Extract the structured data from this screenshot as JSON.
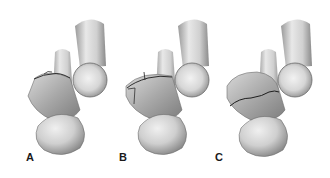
{
  "figure": {
    "panels": [
      {
        "label": "A",
        "fracture": "transverse line across superior articular surface"
      },
      {
        "label": "B",
        "fracture": "comminuted lines across superior and medial surface"
      },
      {
        "label": "C",
        "fracture": "oblique line across body"
      }
    ]
  },
  "colors": {
    "background": "#ffffff",
    "bone_light": "#e6e6e6",
    "bone_mid": "#b8b8b8",
    "bone_dark": "#7a7a7a",
    "fracture_line": "#1e1e1e",
    "label": "#1a1a1a"
  }
}
